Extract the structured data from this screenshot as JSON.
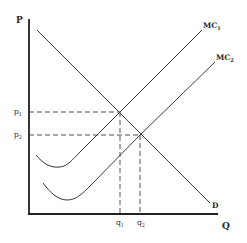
{
  "diagram": {
    "type": "economics-cost-demand",
    "axes": {
      "y_label": "P",
      "x_label": "Q"
    },
    "curves": [
      {
        "id": "demand",
        "label": "D"
      },
      {
        "id": "mc1",
        "label_main": "MC",
        "label_sub": "1"
      },
      {
        "id": "mc2",
        "label_main": "MC",
        "label_sub": "2"
      }
    ],
    "price_levels": [
      {
        "label_main": "p",
        "label_sub": "1"
      },
      {
        "label_main": "p",
        "label_sub": "2"
      }
    ],
    "quantity_levels": [
      {
        "label_main": "q",
        "label_sub": "1"
      },
      {
        "label_main": "q",
        "label_sub": "2"
      }
    ],
    "colors": {
      "line": "#3a3a3a",
      "axis": "#222222",
      "background": "#ffffff"
    }
  }
}
